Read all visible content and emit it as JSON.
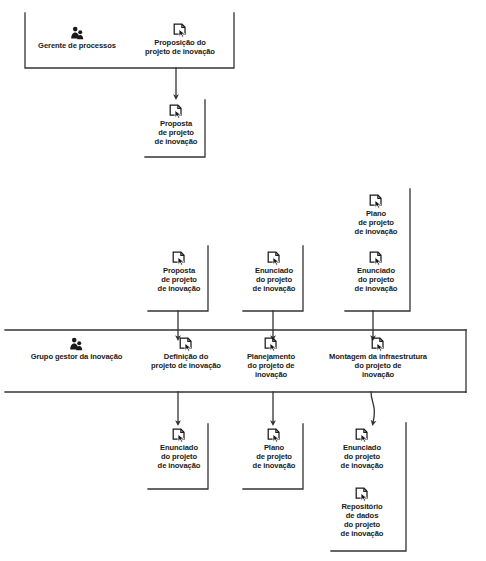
{
  "diagram": {
    "type": "process-flow",
    "line_color": "#333333",
    "text_color": "#1a1a1a"
  },
  "icons": {
    "role": "role-person-icon",
    "document": "document-cursor-icon"
  },
  "groups": {
    "top_band": {
      "name": "proposicao-band",
      "nodes": [
        {
          "id": "gerente-de-processos",
          "icon": "role-person-icon",
          "label": "Gerente de processos",
          "x": 22,
          "y": 26,
          "w": 110
        },
        {
          "id": "proposicao-do-projeto",
          "icon": "document-cursor-icon",
          "label": "Proposição do\nprojeto de inovação",
          "x": 128,
          "y": 23,
          "w": 104
        }
      ]
    },
    "top_output": {
      "name": "proposta-output-group",
      "nodes": [
        {
          "id": "proposta-de-projeto",
          "icon": "document-cursor-icon",
          "label": "Proposta\nde projeto\nde inovação",
          "x": 145,
          "y": 104,
          "w": 62
        }
      ]
    },
    "middle_inputs": {
      "name": "inputs-group",
      "nodes": [
        {
          "id": "proposta-de-projeto-input",
          "icon": "document-cursor-icon",
          "label": "Proposta\nde projeto\nde inovação",
          "x": 148,
          "y": 251,
          "w": 62
        },
        {
          "id": "enunciado-do-projeto-input",
          "icon": "document-cursor-icon",
          "label": "Enunciado\ndo projeto\nde inovação",
          "x": 243,
          "y": 251,
          "w": 62
        },
        {
          "id": "plano-de-projeto-input",
          "icon": "document-cursor-icon",
          "label": "Plano\nde projeto\nde inovação",
          "x": 345,
          "y": 194,
          "w": 62
        },
        {
          "id": "enunciado-do-projeto-input-2",
          "icon": "document-cursor-icon",
          "label": "Enunciado\ndo projeto\nde inovação",
          "x": 345,
          "y": 251,
          "w": 62
        }
      ]
    },
    "main_band": {
      "name": "grupo-gestor-band",
      "nodes": [
        {
          "id": "grupo-gestor-da-inovacao",
          "icon": "role-person-icon",
          "label": "Grupo gestor da inovação",
          "x": 14,
          "y": 337,
          "w": 125
        },
        {
          "id": "definicao-do-projeto",
          "icon": "document-cursor-icon",
          "label": "Definição do\nprojeto de inovação",
          "x": 140,
          "y": 337,
          "w": 92
        },
        {
          "id": "planejamento-do-projeto",
          "icon": "document-cursor-icon",
          "label": "Planejamento\ndo projeto de\ninovação",
          "x": 234,
          "y": 337,
          "w": 74
        },
        {
          "id": "montagem-da-infraestrutura",
          "icon": "document-cursor-icon",
          "label": "Montagem da infraestrutura\ndo projeto de\ninovação",
          "x": 312,
          "y": 337,
          "w": 132
        }
      ]
    },
    "bottom_outputs": {
      "name": "outputs-group",
      "nodes": [
        {
          "id": "enunciado-do-projeto-output",
          "icon": "document-cursor-icon",
          "label": "Enunciado\ndo projeto\nde inovação",
          "x": 148,
          "y": 428,
          "w": 62
        },
        {
          "id": "plano-de-projeto-output",
          "icon": "document-cursor-icon",
          "label": "Plano\nde projeto\nde inovação",
          "x": 243,
          "y": 428,
          "w": 62
        },
        {
          "id": "enunciado-do-projeto-output-2",
          "icon": "document-cursor-icon",
          "label": "Enunciado\ndo projeto\nde inovação",
          "x": 331,
          "y": 428,
          "w": 62
        },
        {
          "id": "repositorio-de-dados",
          "icon": "document-cursor-icon",
          "label": "Repositório\nde dados\ndo projeto\nde inovação",
          "x": 331,
          "y": 487,
          "w": 62
        }
      ]
    }
  }
}
